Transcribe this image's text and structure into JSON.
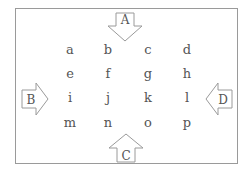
{
  "diagram": {
    "grid": {
      "rows": [
        [
          "a",
          "b",
          "c",
          "d"
        ],
        [
          "e",
          "f",
          "g",
          "h"
        ],
        [
          "i",
          "j",
          "k",
          "l"
        ],
        [
          "m",
          "n",
          "o",
          "p"
        ]
      ]
    },
    "arrows": {
      "top": {
        "label": "A",
        "direction": "down"
      },
      "left": {
        "label": "B",
        "direction": "right"
      },
      "right": {
        "label": "D",
        "direction": "left"
      },
      "bottom": {
        "label": "C",
        "direction": "up"
      }
    },
    "colors": {
      "stroke": "#9a9a9a",
      "text": "#555555"
    }
  }
}
